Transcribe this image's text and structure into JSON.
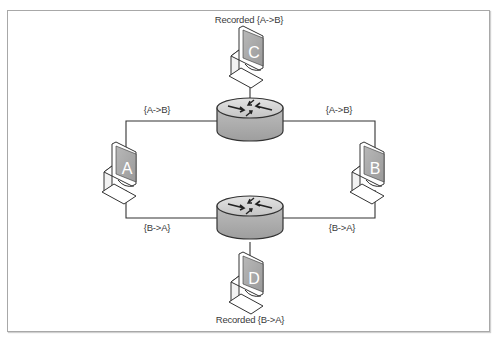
{
  "diagram": {
    "type": "network-topology",
    "nodes": {
      "C": {
        "label": "C",
        "caption": "Recorded {A->B}"
      },
      "A": {
        "label": "A"
      },
      "B": {
        "label": "B"
      },
      "D": {
        "label": "D",
        "caption": "Recorded {B->A}"
      }
    },
    "routers": [
      {
        "id": "router-top"
      },
      {
        "id": "router-bottom"
      }
    ],
    "links": {
      "top_left": "{A->B}",
      "top_right": "{A->B}",
      "bottom_left": "{B->A}",
      "bottom_right": "{B->A}"
    },
    "colors": {
      "line": "#333333",
      "frame": "#a8a8a8",
      "screen": "#a9a9a9",
      "router_top": "#d6d6d6",
      "router_body": "#bdbdbd",
      "text": "#3a3a3a"
    }
  }
}
